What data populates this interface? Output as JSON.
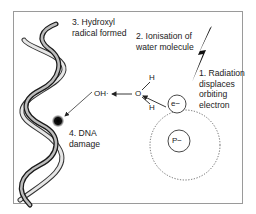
{
  "steps": [
    {
      "number": "1.",
      "lines": [
        "1. Radiation",
        "displaces",
        "orbiting",
        "electron"
      ]
    },
    {
      "number": "2.",
      "lines": [
        "2. Ionisation of",
        "water molecule"
      ]
    },
    {
      "number": "3.",
      "lines": [
        "3. Hydroxyl",
        "radical formed"
      ]
    },
    {
      "number": "4.",
      "lines": [
        "4. DNA",
        "damage"
      ]
    }
  ],
  "molecule": {
    "oxygen": "O",
    "hydrogen_top": "H",
    "hydrogen_bottom": "H",
    "hydroxyl": "OH·"
  },
  "atom": {
    "electron": "e−",
    "proton": "P−"
  },
  "icons": {
    "radiation": "lightning-bolt",
    "dna": "double-helix",
    "damage": "black-dot"
  },
  "colors": {
    "frame": "#9a9a9a",
    "ink": "#1a1a1a",
    "orbit": "#555555"
  }
}
